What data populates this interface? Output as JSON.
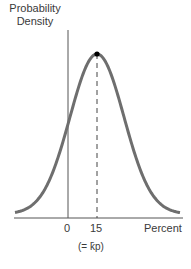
{
  "chart_data": {
    "type": "line",
    "title": "",
    "ylabel": "Probability Density",
    "xlabel": "Percent",
    "x_ticks": [
      "0",
      "15"
    ],
    "annotation": "(= k̄p)",
    "peak": {
      "x": 15,
      "label": "mode / mean"
    },
    "grid": false,
    "legend": null,
    "series": [
      {
        "name": "probability density",
        "distribution": "normal-like bell curve",
        "mean": 15,
        "x": [
          -12,
          -8,
          -4,
          0,
          4,
          8,
          12,
          15,
          18,
          22,
          26,
          30,
          34,
          38,
          42
        ],
        "values": [
          0.03,
          0.08,
          0.19,
          0.38,
          0.62,
          0.85,
          0.97,
          1.0,
          0.97,
          0.85,
          0.62,
          0.38,
          0.19,
          0.08,
          0.03
        ]
      }
    ],
    "colors": {
      "curve": "#6e6e6e",
      "axes": "#555555",
      "marker": "#000000"
    }
  },
  "labels": {
    "y_axis": "Probability Density",
    "x_axis": "Percent",
    "tick_0": "0",
    "tick_15": "15",
    "annotation": "(= k̄p)"
  }
}
